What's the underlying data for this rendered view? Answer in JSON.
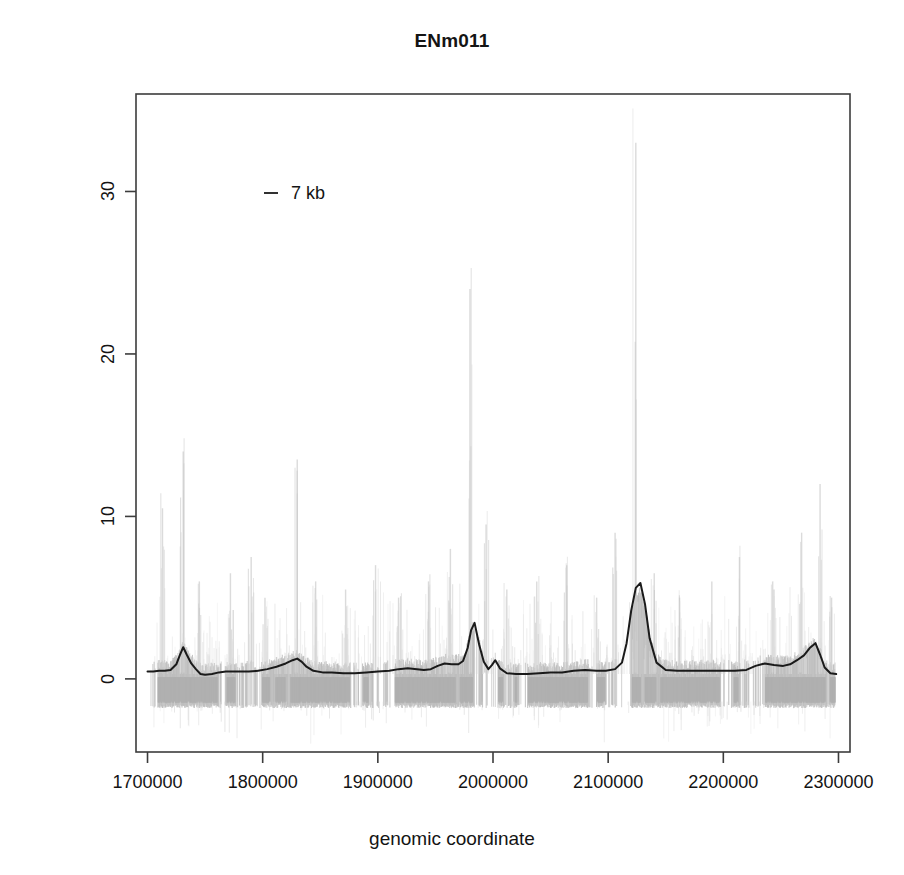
{
  "chart_data": {
    "type": "line",
    "title": "ENm011",
    "xlabel": "genomic coordinate",
    "ylabel": "pseudo median",
    "xlim": [
      1690000,
      2310000
    ],
    "ylim": [
      -4.5,
      36
    ],
    "grid": false,
    "xticks": [
      1700000,
      1800000,
      1900000,
      2000000,
      2100000,
      2200000,
      2300000
    ],
    "xtick_labels": [
      "1700000",
      "1800000",
      "1900000",
      "2000000",
      "2100000",
      "2200000",
      "2300000"
    ],
    "yticks": [
      0,
      10,
      20,
      30
    ],
    "ytick_labels": [
      "0",
      "10",
      "20",
      "30"
    ],
    "legend": {
      "position": "top-left-inside",
      "entries": [
        {
          "label": "7 kb",
          "marker": "dash",
          "color": "#1a1a1a"
        }
      ]
    },
    "series": [
      {
        "name": "7 kb smoothed pseudo median",
        "type": "line",
        "color": "#1a1a1a",
        "linewidth": 2.0,
        "x": [
          1700000,
          1705000,
          1710000,
          1715000,
          1720000,
          1725000,
          1728000,
          1731000,
          1734000,
          1738000,
          1742000,
          1746000,
          1750000,
          1756000,
          1762000,
          1768000,
          1774000,
          1780000,
          1788000,
          1796000,
          1804000,
          1812000,
          1820000,
          1826000,
          1830000,
          1834000,
          1838000,
          1844000,
          1852000,
          1860000,
          1870000,
          1880000,
          1890000,
          1900000,
          1910000,
          1918000,
          1926000,
          1934000,
          1940000,
          1946000,
          1952000,
          1958000,
          1964000,
          1970000,
          1974000,
          1978000,
          1981000,
          1984000,
          1988000,
          1992000,
          1996000,
          1999000,
          2002000,
          2006000,
          2012000,
          2020000,
          2030000,
          2040000,
          2050000,
          2060000,
          2070000,
          2080000,
          2090000,
          2098000,
          2106000,
          2112000,
          2116000,
          2120000,
          2124000,
          2128000,
          2132000,
          2136000,
          2142000,
          2150000,
          2160000,
          2170000,
          2180000,
          2190000,
          2200000,
          2210000,
          2220000,
          2228000,
          2236000,
          2244000,
          2252000,
          2258000,
          2264000,
          2270000,
          2275000,
          2280000,
          2284000,
          2288000,
          2293000,
          2298000
        ],
        "y": [
          0.45,
          0.45,
          0.5,
          0.5,
          0.55,
          0.9,
          1.45,
          1.95,
          1.5,
          0.95,
          0.6,
          0.3,
          0.25,
          0.3,
          0.4,
          0.45,
          0.45,
          0.45,
          0.45,
          0.5,
          0.6,
          0.75,
          0.95,
          1.15,
          1.25,
          1.05,
          0.75,
          0.5,
          0.4,
          0.4,
          0.35,
          0.35,
          0.4,
          0.45,
          0.5,
          0.6,
          0.65,
          0.6,
          0.55,
          0.6,
          0.8,
          0.95,
          0.9,
          0.9,
          1.1,
          1.9,
          3.0,
          3.45,
          2.1,
          1.05,
          0.6,
          0.85,
          1.15,
          0.65,
          0.35,
          0.3,
          0.3,
          0.35,
          0.4,
          0.4,
          0.5,
          0.55,
          0.5,
          0.5,
          0.6,
          1.0,
          2.2,
          4.2,
          5.6,
          5.9,
          4.6,
          2.5,
          1.0,
          0.55,
          0.5,
          0.5,
          0.5,
          0.5,
          0.5,
          0.5,
          0.55,
          0.8,
          0.95,
          0.85,
          0.8,
          0.9,
          1.15,
          1.45,
          1.9,
          2.2,
          1.5,
          0.7,
          0.35,
          0.3
        ]
      },
      {
        "name": "raw pseudo median scatter (gray)",
        "type": "scatter-band",
        "color": "#b8b8b8",
        "description": "dense gray vertical point cloud, band roughly -1.6 to +1.2 with sparse spikes up to ~33",
        "band_low": -1.6,
        "band_high": 1.1,
        "spike_peaks": [
          {
            "x": 1713000,
            "y": 10.5
          },
          {
            "x": 1731000,
            "y": 14.0
          },
          {
            "x": 1745000,
            "y": 6.0
          },
          {
            "x": 1772000,
            "y": 6.5
          },
          {
            "x": 1790000,
            "y": 7.5
          },
          {
            "x": 1802000,
            "y": 5.0
          },
          {
            "x": 1830000,
            "y": 13.5
          },
          {
            "x": 1846000,
            "y": 6.0
          },
          {
            "x": 1872000,
            "y": 5.5
          },
          {
            "x": 1898000,
            "y": 7.0
          },
          {
            "x": 1918000,
            "y": 5.0
          },
          {
            "x": 1944000,
            "y": 6.0
          },
          {
            "x": 1963000,
            "y": 8.0
          },
          {
            "x": 1980000,
            "y": 24.0
          },
          {
            "x": 1994000,
            "y": 9.5
          },
          {
            "x": 2012000,
            "y": 5.5
          },
          {
            "x": 2038000,
            "y": 6.0
          },
          {
            "x": 2064000,
            "y": 7.0
          },
          {
            "x": 2090000,
            "y": 5.0
          },
          {
            "x": 2106000,
            "y": 9.0
          },
          {
            "x": 2124000,
            "y": 33.0
          },
          {
            "x": 2140000,
            "y": 6.5
          },
          {
            "x": 2162000,
            "y": 5.0
          },
          {
            "x": 2190000,
            "y": 6.0
          },
          {
            "x": 2214000,
            "y": 7.5
          },
          {
            "x": 2244000,
            "y": 5.5
          },
          {
            "x": 2268000,
            "y": 9.0
          },
          {
            "x": 2284000,
            "y": 12.0
          },
          {
            "x": 2294000,
            "y": 5.0
          }
        ]
      }
    ]
  },
  "colors": {
    "line": "#1a1a1a",
    "scatter": "#b8b8b8",
    "axis": "#3c3c3c",
    "background": "#ffffff"
  }
}
